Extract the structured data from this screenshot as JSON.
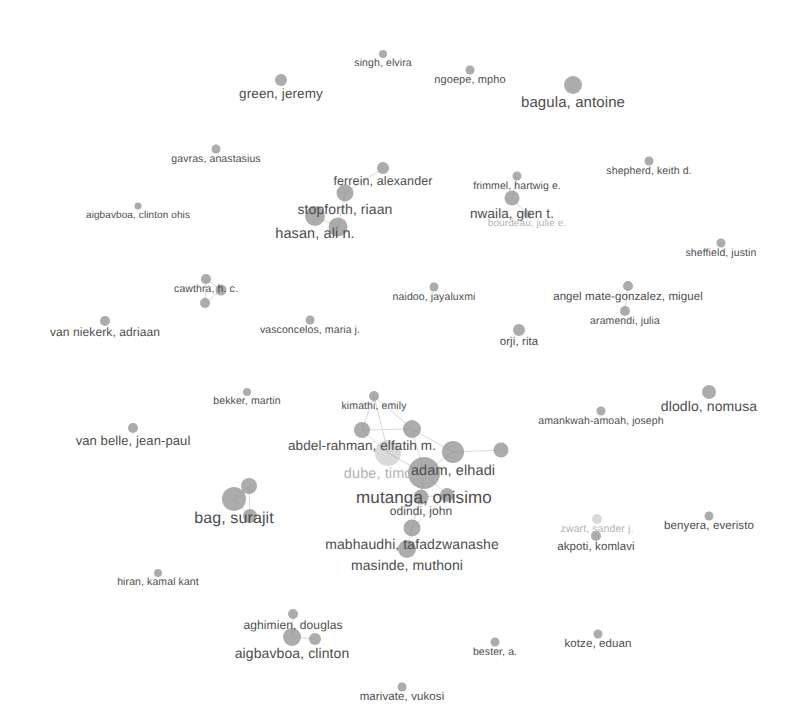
{
  "visualization": {
    "type": "bibliometric-network-map",
    "tool_style": "VOSviewer author co-authorship network",
    "width": 801,
    "height": 712,
    "background_color": "#ffffff",
    "label_color": "#4d4d4d",
    "node_color": "#8c8c8c",
    "edge_color": "#d9d9d9",
    "faded_label_color": "#b3b3b3"
  },
  "chart_data": {
    "type": "scatter",
    "title": "",
    "xlabel": "",
    "ylabel": "",
    "grid": false,
    "legend": "none",
    "nodes": [
      {
        "label": "singh, elvira",
        "x": 383,
        "y": 54,
        "r": 4.0,
        "font": 10.5,
        "opacity": 1.0
      },
      {
        "label": "green, jeremy",
        "x": 281,
        "y": 80,
        "r": 6.0,
        "font": 13.5,
        "opacity": 1.0
      },
      {
        "label": "ngoepe, mpho",
        "x": 470,
        "y": 70,
        "r": 4.5,
        "font": 11.0,
        "opacity": 1.0
      },
      {
        "label": "bagula, antoine",
        "x": 573,
        "y": 85,
        "r": 9.0,
        "font": 15.0,
        "opacity": 1.0
      },
      {
        "label": "gavras, anastasius",
        "x": 216,
        "y": 149,
        "r": 4.5,
        "font": 10.5,
        "opacity": 1.0
      },
      {
        "label": "ferrein, alexander",
        "x": 383,
        "y": 168,
        "r": 6.0,
        "font": 12.5,
        "opacity": 1.0
      },
      {
        "label": "stopforth, riaan",
        "x": 345,
        "y": 193,
        "r": 8.5,
        "font": 14.0,
        "opacity": 1.0
      },
      {
        "label": "hasan, ali n.",
        "x": 315,
        "y": 216,
        "r": 10.0,
        "font": 14.5,
        "opacity": 1.0
      },
      {
        "label": "",
        "x": 338,
        "y": 227,
        "r": 9.5,
        "font": 0,
        "opacity": 1.0
      },
      {
        "label": "aigbavboa, clinton ohis",
        "x": 138,
        "y": 206,
        "r": 3.5,
        "font": 10.0,
        "opacity": 1.0
      },
      {
        "label": "frimmel, hartwig e.",
        "x": 517,
        "y": 176,
        "r": 4.5,
        "font": 10.5,
        "opacity": 1.0
      },
      {
        "label": "nwaila, glen t.",
        "x": 512,
        "y": 198,
        "r": 7.5,
        "font": 13.5,
        "opacity": 1.0
      },
      {
        "label": "bourdeau, julie e.",
        "x": 527,
        "y": 214,
        "r": 4.0,
        "font": 10.0,
        "opacity": 0.62
      },
      {
        "label": "shepherd, keith d.",
        "x": 649,
        "y": 161,
        "r": 4.5,
        "font": 10.5,
        "opacity": 1.0
      },
      {
        "label": "sheffield, justin",
        "x": 721,
        "y": 243,
        "r": 4.5,
        "font": 10.5,
        "opacity": 1.0
      },
      {
        "label": "cawthra, h. c.",
        "x": 206,
        "y": 279,
        "r": 5.0,
        "font": 10.5,
        "opacity": 1.0
      },
      {
        "label": "",
        "x": 221,
        "y": 290,
        "r": 5.5,
        "font": 0,
        "opacity": 1.0
      },
      {
        "label": "",
        "x": 205,
        "y": 303,
        "r": 5.0,
        "font": 0,
        "opacity": 1.0
      },
      {
        "label": "van niekerk, adriaan",
        "x": 105,
        "y": 321,
        "r": 5.0,
        "font": 12.0,
        "opacity": 1.0
      },
      {
        "label": "vasconcelos, maria j.",
        "x": 310,
        "y": 320,
        "r": 4.5,
        "font": 10.5,
        "opacity": 1.0
      },
      {
        "label": "naidoo, jayaluxmi",
        "x": 434,
        "y": 287,
        "r": 4.5,
        "font": 10.5,
        "opacity": 1.0
      },
      {
        "label": "angel mate-gonzalez, miguel",
        "x": 628,
        "y": 286,
        "r": 5.0,
        "font": 11.5,
        "opacity": 1.0
      },
      {
        "label": "aramendi, julia",
        "x": 625,
        "y": 311,
        "r": 5.0,
        "font": 10.5,
        "opacity": 1.0
      },
      {
        "label": "orji, rita",
        "x": 519,
        "y": 330,
        "r": 6.0,
        "font": 11.5,
        "opacity": 1.0
      },
      {
        "label": "bekker, martin",
        "x": 247,
        "y": 392,
        "r": 4.0,
        "font": 10.5,
        "opacity": 1.0
      },
      {
        "label": "van belle, jean-paul",
        "x": 133,
        "y": 428,
        "r": 5.0,
        "font": 13.0,
        "opacity": 1.0
      },
      {
        "label": "kimathi, emily",
        "x": 374,
        "y": 396,
        "r": 5.0,
        "font": 10.5,
        "opacity": 1.0
      },
      {
        "label": "dlodlo, nomusa",
        "x": 709,
        "y": 392,
        "r": 7.0,
        "font": 14.0,
        "opacity": 1.0
      },
      {
        "label": "amankwah-amoah, joseph",
        "x": 601,
        "y": 411,
        "r": 4.5,
        "font": 10.5,
        "opacity": 1.0
      },
      {
        "label": "abdel-rahman, elfatih m.",
        "x": 362,
        "y": 430,
        "r": 8.0,
        "font": 13.5,
        "opacity": 1.0
      },
      {
        "label": "",
        "x": 412,
        "y": 429,
        "r": 9.0,
        "font": 0,
        "opacity": 1.0
      },
      {
        "label": "dube, timothy",
        "x": 388,
        "y": 453,
        "r": 13.0,
        "font": 14.5,
        "opacity": 0.45
      },
      {
        "label": "adam, elhadi",
        "x": 453,
        "y": 452,
        "r": 11.0,
        "font": 14.5,
        "opacity": 1.0
      },
      {
        "label": "",
        "x": 501,
        "y": 450,
        "r": 7.5,
        "font": 0,
        "opacity": 1.0
      },
      {
        "label": "mutanga, onisimo",
        "x": 424,
        "y": 473,
        "r": 16.0,
        "font": 17.0,
        "opacity": 1.0
      },
      {
        "label": "odindi, john",
        "x": 421,
        "y": 497,
        "r": 7.5,
        "font": 12.0,
        "opacity": 1.0
      },
      {
        "label": "",
        "x": 447,
        "y": 495,
        "r": 7.0,
        "font": 0,
        "opacity": 1.0
      },
      {
        "label": "bag, surajit",
        "x": 234,
        "y": 499,
        "r": 12.0,
        "font": 16.0,
        "opacity": 1.0
      },
      {
        "label": "",
        "x": 249,
        "y": 486,
        "r": 8.0,
        "font": 0,
        "opacity": 1.0
      },
      {
        "label": "",
        "x": 250,
        "y": 516,
        "r": 7.0,
        "font": 0,
        "opacity": 1.0
      },
      {
        "label": "mabhaudhi, tafadzwanashe",
        "x": 412,
        "y": 528,
        "r": 8.5,
        "font": 14.0,
        "opacity": 1.0
      },
      {
        "label": "masinde, muthoni",
        "x": 407,
        "y": 549,
        "r": 9.0,
        "font": 14.0,
        "opacity": 1.0
      },
      {
        "label": "zwart, sander j.",
        "x": 597,
        "y": 519,
        "r": 5.0,
        "font": 10.5,
        "opacity": 0.45
      },
      {
        "label": "benyera, everisto",
        "x": 709,
        "y": 516,
        "r": 4.5,
        "font": 11.5,
        "opacity": 1.0
      },
      {
        "label": "akpoti, komlavi",
        "x": 596,
        "y": 536,
        "r": 5.0,
        "font": 11.5,
        "opacity": 1.0
      },
      {
        "label": "hiran, kamal kant",
        "x": 158,
        "y": 573,
        "r": 4.0,
        "font": 10.5,
        "opacity": 1.0
      },
      {
        "label": "aghimien, douglas",
        "x": 293,
        "y": 614,
        "r": 5.0,
        "font": 12.0,
        "opacity": 1.0
      },
      {
        "label": "aigbavboa, clinton",
        "x": 292,
        "y": 637,
        "r": 9.0,
        "font": 14.0,
        "opacity": 1.0
      },
      {
        "label": "",
        "x": 315,
        "y": 639,
        "r": 6.0,
        "font": 0,
        "opacity": 1.0
      },
      {
        "label": "bester, a.",
        "x": 495,
        "y": 642,
        "r": 4.5,
        "font": 10.5,
        "opacity": 1.0
      },
      {
        "label": "kotze, eduan",
        "x": 598,
        "y": 634,
        "r": 4.5,
        "font": 11.5,
        "opacity": 1.0
      },
      {
        "label": "marivate, vukosi",
        "x": 402,
        "y": 687,
        "r": 4.5,
        "font": 11.5,
        "opacity": 1.0
      }
    ],
    "edges": [
      {
        "from": [
          374,
          396
        ],
        "to": [
          362,
          430
        ]
      },
      {
        "from": [
          374,
          396
        ],
        "to": [
          412,
          429
        ]
      },
      {
        "from": [
          374,
          396
        ],
        "to": [
          388,
          453
        ]
      },
      {
        "from": [
          362,
          430
        ],
        "to": [
          412,
          429
        ]
      },
      {
        "from": [
          362,
          430
        ],
        "to": [
          388,
          453
        ]
      },
      {
        "from": [
          412,
          429
        ],
        "to": [
          453,
          452
        ]
      },
      {
        "from": [
          412,
          429
        ],
        "to": [
          424,
          473
        ]
      },
      {
        "from": [
          388,
          453
        ],
        "to": [
          424,
          473
        ]
      },
      {
        "from": [
          453,
          452
        ],
        "to": [
          424,
          473
        ]
      },
      {
        "from": [
          453,
          452
        ],
        "to": [
          501,
          450
        ]
      },
      {
        "from": [
          424,
          473
        ],
        "to": [
          421,
          497
        ]
      },
      {
        "from": [
          424,
          473
        ],
        "to": [
          447,
          495
        ]
      },
      {
        "from": [
          421,
          497
        ],
        "to": [
          447,
          495
        ]
      },
      {
        "from": [
          421,
          497
        ],
        "to": [
          412,
          528
        ]
      },
      {
        "from": [
          447,
          495
        ],
        "to": [
          412,
          528
        ]
      },
      {
        "from": [
          412,
          528
        ],
        "to": [
          407,
          549
        ]
      },
      {
        "from": [
          206,
          279
        ],
        "to": [
          221,
          290
        ]
      },
      {
        "from": [
          206,
          279
        ],
        "to": [
          205,
          303
        ]
      },
      {
        "from": [
          221,
          290
        ],
        "to": [
          205,
          303
        ]
      },
      {
        "from": [
          315,
          216
        ],
        "to": [
          338,
          227
        ]
      },
      {
        "from": [
          345,
          193
        ],
        "to": [
          338,
          227
        ]
      },
      {
        "from": [
          345,
          193
        ],
        "to": [
          383,
          168
        ]
      },
      {
        "from": [
          234,
          499
        ],
        "to": [
          249,
          486
        ]
      },
      {
        "from": [
          234,
          499
        ],
        "to": [
          250,
          516
        ]
      },
      {
        "from": [
          249,
          486
        ],
        "to": [
          250,
          516
        ]
      },
      {
        "from": [
          292,
          637
        ],
        "to": [
          315,
          639
        ]
      },
      {
        "from": [
          292,
          637
        ],
        "to": [
          293,
          614
        ]
      },
      {
        "from": [
          512,
          198
        ],
        "to": [
          517,
          176
        ]
      },
      {
        "from": [
          512,
          198
        ],
        "to": [
          527,
          214
        ]
      },
      {
        "from": [
          628,
          286
        ],
        "to": [
          625,
          311
        ]
      }
    ]
  }
}
